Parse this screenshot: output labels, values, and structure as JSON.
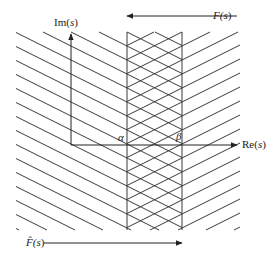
{
  "diagram": {
    "colors": {
      "stroke": "#3a3a3a",
      "text": "#222222"
    },
    "axes": {
      "imag_label_pre": "Im(",
      "imag_label_var": "s",
      "imag_label_post": ")",
      "real_label_pre": "Re(",
      "real_label_var": "s",
      "real_label_post": ")",
      "origin": [
        71,
        145
      ],
      "imag_top": 34,
      "real_right": 237
    },
    "strip": {
      "alpha_label": "α",
      "beta_label": "β",
      "alpha_x": 127,
      "beta_x": 182,
      "top": 32,
      "bottom": 230
    },
    "hatch": {
      "left_x": 16,
      "right_x": 240,
      "spacing": 14,
      "slope": 0.5
    },
    "arrows": {
      "F_label_pre": "F(",
      "F_label_var": "s",
      "F_label_post": ")",
      "F_y": 16,
      "F_from_x": 237,
      "F_to_x": 127,
      "Fhat_label_pre": "F̂(",
      "Fhat_label_var": "s",
      "Fhat_label_post": ")",
      "Fhat_y": 243,
      "Fhat_from_x": 44,
      "Fhat_to_x": 182
    }
  }
}
